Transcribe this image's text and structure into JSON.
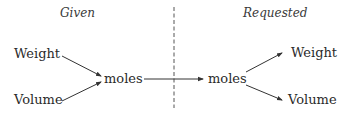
{
  "diagram": {
    "headers": {
      "given": "Given",
      "requested": "Requested"
    },
    "given_nodes": [
      {
        "label": "Weight"
      },
      {
        "label": "Volume"
      }
    ],
    "center_left": {
      "label": "moles"
    },
    "center_right": {
      "label": "moles"
    },
    "requested_nodes": [
      {
        "label": "Weight"
      },
      {
        "label": "Volume"
      }
    ],
    "colors": {
      "text": "#2a2a2a",
      "arrow": "#333333",
      "divider": "#555555"
    }
  }
}
